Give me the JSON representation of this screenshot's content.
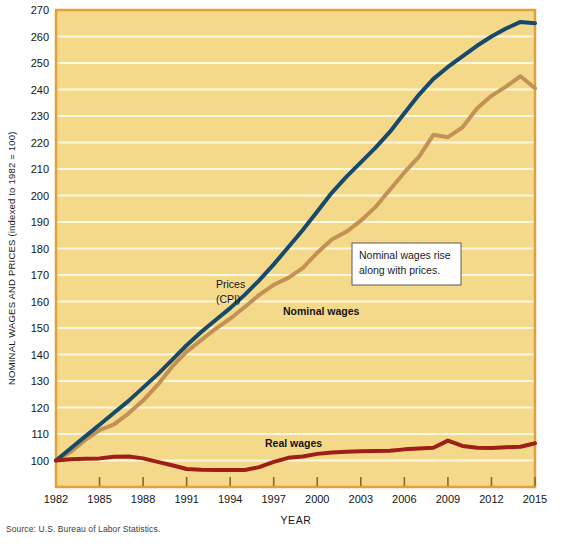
{
  "figure": {
    "source_note": "Source: U.S. Bureau of Labor Statistics.",
    "background_color": "#f5d98a",
    "plot_border_color": "#e39f3a",
    "gridline_color": "#fdf6e0"
  },
  "annotations": {
    "callout": {
      "line1": "Nominal wages rise",
      "line2": "along with prices.",
      "border_color": "#5a5a5a",
      "fill_color": "#ffffff"
    },
    "prices_label_line1": "Prices",
    "prices_label_line2": "(CPI)",
    "nominal_label": "Nominal wages",
    "real_label": "Real wages"
  },
  "chart_data": {
    "type": "line",
    "title": "",
    "xlabel": "YEAR",
    "ylabel": "NOMINAL WAGES AND PRICES (indexed to 1982 = 100)",
    "xlim": [
      1982,
      2015
    ],
    "ylim": [
      90,
      270
    ],
    "yticks": [
      100,
      110,
      120,
      130,
      140,
      150,
      160,
      170,
      180,
      190,
      200,
      210,
      220,
      230,
      240,
      250,
      260,
      270
    ],
    "ytick_labels": [
      "100",
      "110",
      "120",
      "130",
      "140",
      "150",
      "160",
      "170",
      "180",
      "190",
      "200",
      "210",
      "220",
      "230",
      "240",
      "250",
      "260",
      "270"
    ],
    "xticks": [
      1982,
      1985,
      1988,
      1991,
      1994,
      1997,
      2000,
      2003,
      2006,
      2009,
      2012,
      2015
    ],
    "xtick_labels": [
      "1982",
      "1985",
      "1988",
      "1991",
      "1994",
      "1997",
      "2000",
      "2003",
      "2006",
      "2009",
      "2012",
      "2015"
    ],
    "grid": true,
    "legend_position": "inline-labels",
    "x": [
      1982,
      1983,
      1984,
      1985,
      1986,
      1987,
      1988,
      1989,
      1990,
      1991,
      1992,
      1993,
      1994,
      1995,
      1996,
      1997,
      1998,
      1999,
      2000,
      2001,
      2002,
      2003,
      2004,
      2005,
      2006,
      2007,
      2008,
      2009,
      2010,
      2011,
      2012,
      2013,
      2014,
      2015
    ],
    "series": [
      {
        "name": "Nominal wages",
        "color": "#17496b",
        "values": [
          100.0,
          104.5,
          109.0,
          113.5,
          118.0,
          122.5,
          127.5,
          132.5,
          138.0,
          143.5,
          148.5,
          153.0,
          157.5,
          162.5,
          168.0,
          174.0,
          180.5,
          187.0,
          194.0,
          201.0,
          207.0,
          212.5,
          218.0,
          224.0,
          231.0,
          238.0,
          244.0,
          248.5,
          252.5,
          256.5,
          260.0,
          263.0,
          265.5,
          265.0
        ]
      },
      {
        "name": "Prices (CPI)",
        "color": "#c29155",
        "values": [
          100.0,
          103.2,
          107.7,
          111.5,
          113.6,
          117.8,
          122.6,
          128.5,
          135.4,
          141.1,
          145.4,
          149.7,
          153.5,
          157.9,
          162.5,
          166.3,
          168.9,
          172.6,
          178.4,
          183.4,
          186.3,
          190.5,
          195.6,
          202.2,
          208.7,
          214.6,
          222.9,
          222.0,
          225.7,
          232.8,
          237.6,
          241.1,
          245.0,
          240.5
        ]
      },
      {
        "name": "Real wages",
        "color": "#9e1f16",
        "values": [
          100.0,
          100.5,
          100.7,
          100.8,
          101.4,
          101.5,
          100.8,
          99.5,
          98.2,
          96.8,
          96.5,
          96.4,
          96.4,
          96.4,
          97.5,
          99.5,
          101.0,
          101.5,
          102.5,
          103.0,
          103.3,
          103.5,
          103.6,
          103.7,
          104.2,
          104.5,
          104.8,
          107.5,
          105.5,
          104.8,
          104.7,
          105.0,
          105.2,
          106.5
        ]
      }
    ]
  }
}
